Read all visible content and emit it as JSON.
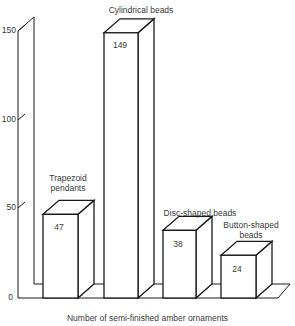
{
  "chart_data": {
    "type": "bar",
    "style": "3d-bar",
    "title": "",
    "xlabel": "Number of semi-finished amber ornaments",
    "ylabel": "",
    "ylim": [
      0,
      150
    ],
    "yticks": [
      0,
      50,
      100,
      150
    ],
    "grid": false,
    "legend": null,
    "categories": [
      "Trapezoid pendants",
      "Cylindrical beads",
      "Disc-shaped beads",
      "Button-shaped beads"
    ],
    "values": [
      47,
      149,
      38,
      24
    ],
    "data_labels": [
      "47",
      "149",
      "38",
      "24"
    ]
  },
  "labels": {
    "yticks": [
      "0",
      "50",
      "100",
      "150"
    ],
    "categories": [
      "Trapezoid\npendants",
      "Cylindrical beads",
      "Disc-shaped beads",
      "Button-shaped\nbeads"
    ],
    "values": [
      "47",
      "149",
      "38",
      "24"
    ],
    "xlabel": "Number of semi-finished amber ornaments"
  },
  "colors": {
    "line": "#1a1a1a",
    "fill": "#ffffff",
    "text": "#3a3a3a"
  }
}
